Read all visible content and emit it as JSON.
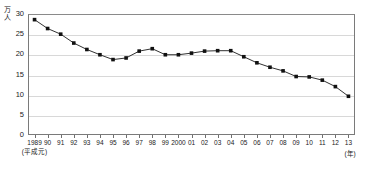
{
  "chart_data": {
    "type": "line",
    "title": "",
    "xlabel": "(年)",
    "ylabel": "万人",
    "y_unit_chars": [
      "万",
      "人"
    ],
    "era_note": "(平成元)",
    "categories": [
      "1989",
      "90",
      "91",
      "92",
      "93",
      "94",
      "95",
      "96",
      "97",
      "98",
      "99",
      "2000",
      "01",
      "02",
      "03",
      "04",
      "05",
      "06",
      "07",
      "08",
      "09",
      "10",
      "11",
      "12",
      "13"
    ],
    "values": [
      28.6,
      26.4,
      25.0,
      22.8,
      21.2,
      19.9,
      18.7,
      19.1,
      20.8,
      21.4,
      19.9,
      19.9,
      20.3,
      20.8,
      20.9,
      20.9,
      19.4,
      17.9,
      16.8,
      15.9,
      14.5,
      14.4,
      13.6,
      12.0,
      9.6
    ],
    "series": [
      {
        "name": "series-1",
        "values": [
          28.6,
          26.4,
          25.0,
          22.8,
          21.2,
          19.9,
          18.7,
          19.1,
          20.8,
          21.4,
          19.9,
          19.9,
          20.3,
          20.8,
          20.9,
          20.9,
          19.4,
          17.9,
          16.8,
          15.9,
          14.5,
          14.4,
          13.6,
          12.0,
          9.6
        ]
      }
    ],
    "yticks": [
      0,
      5,
      10,
      15,
      20,
      25,
      30
    ],
    "ylim": [
      0,
      30
    ],
    "grid": true,
    "legend": "none",
    "marker": "square",
    "line_color": "#1a1a1a",
    "grid_color": "#d8d8d8",
    "frame_color": "#7a7a7a"
  }
}
